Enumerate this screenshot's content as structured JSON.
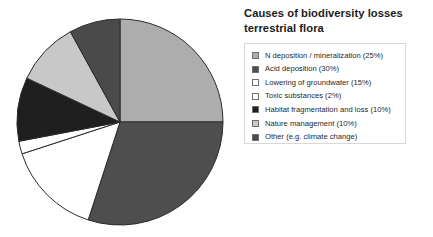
{
  "chart_data": {
    "type": "pie",
    "title": "Causes of biodiversity losses terrestrial flora",
    "title_lines": [
      "Causes of biodiversity losses",
      "terrestrial flora"
    ],
    "legend_position": "right",
    "start_angle_deg": 0,
    "direction": "clockwise",
    "categories": [
      "N deposition / mineralization",
      "Acid deposition",
      "Lowering of groundwater",
      "Toxic substances",
      "Habitat fragmentation and loss",
      "Nature management",
      "Other (e.g. climate change)"
    ],
    "values": [
      25,
      30,
      15,
      2,
      10,
      10,
      8
    ],
    "value_labels": [
      "25%",
      "30%",
      "15%",
      "2%",
      "10%",
      "10%",
      ""
    ],
    "colors": [
      "#adadad",
      "#4e4e4e",
      "#ffffff",
      "#ffffff",
      "#1f1f1f",
      "#c8c8c8",
      "#4a4a4a"
    ],
    "slice_border_color": "#2b2b2b",
    "legend_entries": [
      {
        "label": "N deposition / mineralization (25%)",
        "color": "#adadad"
      },
      {
        "label": "Acid deposition (30%)",
        "color": "#4e4e4e"
      },
      {
        "label": "Lowering of groundwater (15%)",
        "color": "#ffffff"
      },
      {
        "label": "Toxic substances (2%)",
        "color": "#ffffff"
      },
      {
        "label": "Habitat fragmentation and loss (10%)",
        "color": "#1f1f1f"
      },
      {
        "label": "Nature management (10%)",
        "color": "#c8c8c8"
      },
      {
        "label": "Other (e.g. climate change)",
        "color": "#4a4a4a"
      }
    ]
  }
}
